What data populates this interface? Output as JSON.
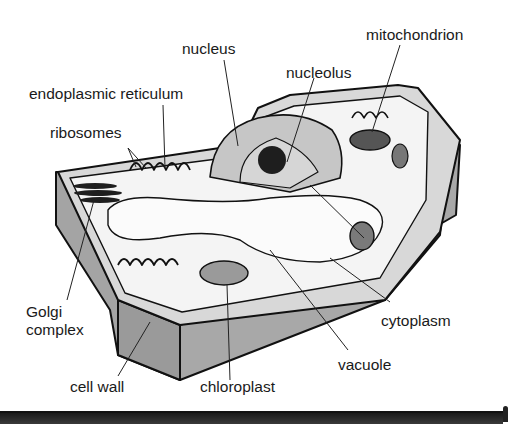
{
  "diagram": {
    "labels": {
      "nucleus": "nucleus",
      "nucleolus": "nucleolus",
      "mitochondrion": "mitochondrion",
      "endoplasmic_reticulum": "endoplasmic reticulum",
      "ribosomes": "ribosomes",
      "golgi_line1": "Golgi",
      "golgi_line2": "complex",
      "cell_wall": "cell wall",
      "chloroplast": "chloroplast",
      "vacuole": "vacuole",
      "cytoplasm": "cytoplasm"
    },
    "colors": {
      "wall_gray": "#a8a8a8",
      "wall_dark": "#8f8f8f",
      "cytoplasm": "#f2f2f2",
      "vacuole": "#fbfbfb",
      "nucleus": "#c4c4c4",
      "organelle_dark": "#2a2a2a",
      "outline": "#111111",
      "bar": "#2a2a2a"
    }
  }
}
